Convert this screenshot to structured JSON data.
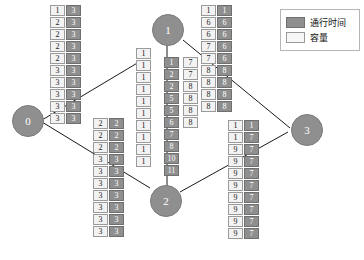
{
  "legend": {
    "items": [
      {
        "key": "time",
        "label": "通行时间",
        "color": "#8f8f8f"
      },
      {
        "key": "capacity",
        "label": "容量",
        "color": "#f7f7f7"
      }
    ]
  },
  "nodes": [
    {
      "id": "node-0",
      "label": "0",
      "x": 12,
      "y": 105,
      "size": 30
    },
    {
      "id": "node-1",
      "label": "1",
      "x": 152,
      "y": 14,
      "size": 30
    },
    {
      "id": "node-2",
      "label": "2",
      "x": 150,
      "y": 185,
      "size": 30
    },
    {
      "id": "node-3",
      "label": "3",
      "x": 291,
      "y": 114,
      "size": 30
    }
  ],
  "edges": [
    {
      "from": "node-0",
      "to": "node-1",
      "path": "M 42,120 L 139,62"
    },
    {
      "from": "node-0",
      "to": "node-2",
      "path": "M 42,122 L 150,188"
    },
    {
      "from": "node-1",
      "to": "node-3",
      "path": "M 183,40 L 290,128"
    },
    {
      "from": "node-2",
      "to": "node-3",
      "path": "M 180,192 L 288,132"
    },
    {
      "from": "node-2",
      "to": "node-1",
      "path": "M 167,186 L 167,30",
      "arrow": true
    }
  ],
  "stacks": [
    {
      "name": "stack-top-left",
      "x": 50,
      "y": 5,
      "capacity": [
        "1",
        "2",
        "2",
        "2",
        "2",
        "3",
        "3",
        "3",
        "3",
        "3"
      ],
      "time": [
        "3",
        "3",
        "3",
        "3",
        "3",
        "3",
        "3",
        "3",
        "3",
        "3"
      ]
    },
    {
      "name": "stack-lower-left",
      "x": 93,
      "y": 118,
      "capacity": [
        "2",
        "2",
        "2",
        "3",
        "3",
        "3",
        "3",
        "3",
        "3",
        "3"
      ],
      "time": [
        "2",
        "2",
        "2",
        "3",
        "3",
        "3",
        "3",
        "3",
        "3",
        "3"
      ]
    },
    {
      "name": "stack-center-capacity",
      "x": 136,
      "y": 48,
      "capacity": [
        "1",
        "1",
        "1",
        "1",
        "1",
        "1",
        "1",
        "1",
        "1",
        "1"
      ],
      "time": []
    },
    {
      "name": "stack-center-main",
      "x": 164,
      "y": 57,
      "capacity": [],
      "time": [
        "1",
        "2",
        "2",
        "5",
        "5",
        "6",
        "7",
        "8",
        "10",
        "11"
      ]
    },
    {
      "name": "stack-center-right-capacity",
      "x": 183,
      "y": 57,
      "capacity": [
        "7",
        "7",
        "8",
        "8",
        "8",
        "8"
      ],
      "time": []
    },
    {
      "name": "stack-top-right",
      "x": 201,
      "y": 5,
      "capacity": [
        "1",
        "6",
        "6",
        "7",
        "7",
        "8",
        "8",
        "8",
        "8"
      ],
      "time": [
        "1",
        "6",
        "6",
        "6",
        "6",
        "8",
        "8",
        "8",
        "8"
      ]
    },
    {
      "name": "stack-bottom-right",
      "x": 228,
      "y": 120,
      "capacity": [
        "1",
        "1",
        "9",
        "9",
        "9",
        "9",
        "9",
        "9",
        "9",
        "9"
      ],
      "time": [
        "1",
        "7",
        "7",
        "7",
        "7",
        "7",
        "7",
        "7",
        "7",
        "7"
      ]
    }
  ]
}
